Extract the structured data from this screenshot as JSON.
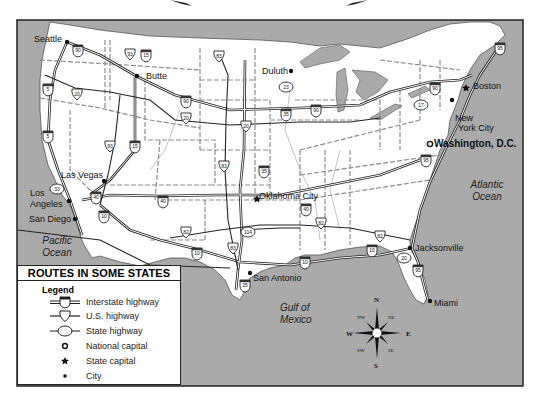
{
  "map": {
    "colors": {
      "water": "#aaaaaa",
      "land": "#ffffff",
      "border": "#222222",
      "state_line": "#8c8c8c",
      "road": "#222222"
    },
    "cities": [
      {
        "name": "Seattle",
        "type": "city"
      },
      {
        "name": "Butte",
        "type": "city"
      },
      {
        "name": "Duluth",
        "type": "city"
      },
      {
        "name": "Boston",
        "type": "state-capital"
      },
      {
        "name": "New York City",
        "type": "city"
      },
      {
        "name": "Washington, D.C.",
        "type": "national-capital"
      },
      {
        "name": "Las Vegas",
        "type": "city"
      },
      {
        "name": "Los Angeles",
        "type": "city"
      },
      {
        "name": "San Diego",
        "type": "city"
      },
      {
        "name": "Oklahoma City",
        "type": "state-capital"
      },
      {
        "name": "San Antonio",
        "type": "city"
      },
      {
        "name": "Jacksonville",
        "type": "city"
      },
      {
        "name": "Miami",
        "type": "city"
      }
    ],
    "labels": {
      "seattle": "Seattle",
      "butte": "Butte",
      "duluth": "Duluth",
      "boston": "Boston",
      "nyc_1": "New",
      "nyc_2": "York City",
      "dc": "Washington, D.C.",
      "las_vegas": "Las Vegas",
      "la_1": "Los",
      "la_2": "Angeles",
      "san_diego": "San Diego",
      "okc": "Oklahoma City",
      "san_antonio": "San Antonio",
      "jacksonville": "Jacksonville",
      "miami": "Miami"
    },
    "water_labels": {
      "pacific_1": "Pacific",
      "pacific_2": "Ocean",
      "atlantic_1": "Atlantic",
      "atlantic_2": "Ocean",
      "gulf_1": "Gulf of",
      "gulf_2": "Mexico"
    },
    "route_shields": {
      "interstate": [
        "90",
        "5",
        "15",
        "94",
        "35",
        "40",
        "10",
        "95",
        "80"
      ],
      "us": [
        "93",
        "83",
        "20",
        "82",
        "114"
      ],
      "state": [
        "17",
        "23",
        "33"
      ]
    },
    "compass": {
      "n": "N",
      "s": "S",
      "e": "E",
      "w": "W",
      "ne": "NE",
      "nw": "NW",
      "se": "SE",
      "sw": "SW"
    }
  },
  "legend": {
    "title": "ROUTES IN SOME STATES",
    "heading": "Legend",
    "items": [
      {
        "symbol": "interstate-shield",
        "label": "Interstate highway"
      },
      {
        "symbol": "us-shield",
        "label": "U.S. highway"
      },
      {
        "symbol": "state-oval",
        "label": "State highway"
      },
      {
        "symbol": "national-capital-icon",
        "label": "National capital"
      },
      {
        "symbol": "state-capital-icon",
        "label": "State capital"
      },
      {
        "symbol": "city-dot-icon",
        "label": "City"
      }
    ]
  }
}
